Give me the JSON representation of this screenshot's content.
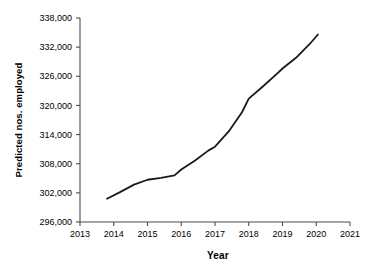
{
  "chart_data": {
    "type": "line",
    "title": "",
    "xlabel": "Year",
    "ylabel": "Predicted nos. employed",
    "xlim": [
      2013,
      2021
    ],
    "ylim": [
      296000,
      338000
    ],
    "grid": false,
    "legend": "none",
    "xticks": [
      "2013",
      "2014",
      "2015",
      "2016",
      "2017",
      "2018",
      "2019",
      "2020",
      "2021"
    ],
    "xtick_values": [
      2013,
      2014,
      2015,
      2016,
      2017,
      2018,
      2019,
      2020,
      2021
    ],
    "yticks": [
      "296,000",
      "302,000",
      "308,000",
      "314,000",
      "320,000",
      "326,000",
      "332,000",
      "338,000"
    ],
    "ytick_values": [
      296000,
      302000,
      308000,
      314000,
      320000,
      326000,
      332000,
      338000
    ],
    "series": [
      {
        "name": "Predicted nos. employed",
        "color": "#1a1a1a",
        "line_width": 1.8,
        "x": [
          2013.8,
          2014.2,
          2014.6,
          2015.0,
          2015.4,
          2015.8,
          2016.0,
          2016.4,
          2016.8,
          2017.0,
          2017.4,
          2017.8,
          2018.0,
          2018.4,
          2018.8,
          2019.0,
          2019.4,
          2019.8,
          2020.05
        ],
        "y": [
          300800,
          302200,
          303700,
          304700,
          305100,
          305600,
          306800,
          308600,
          310700,
          311500,
          314600,
          318600,
          321400,
          323800,
          326300,
          327600,
          329800,
          332600,
          334600
        ]
      }
    ]
  },
  "axes": {
    "x_axis_name": "year-axis",
    "y_axis_name": "predicted-employment-axis"
  }
}
